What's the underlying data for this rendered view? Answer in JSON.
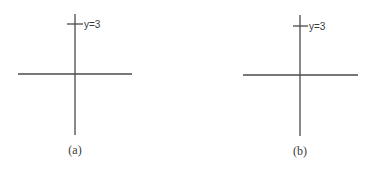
{
  "panels": [
    {
      "id": "a",
      "caption": "(a)",
      "tick_label": "y=3",
      "origin": {
        "x": 75,
        "y": 74
      },
      "x_axis": {
        "x1": 18,
        "x2": 132
      },
      "y_axis": {
        "y1": 14,
        "y2": 135
      },
      "tick": {
        "y": 24,
        "x1": 67,
        "x2": 83
      },
      "caption_pos": {
        "x": 75,
        "y": 154
      }
    },
    {
      "id": "b",
      "caption": "(b)",
      "tick_label": "y=3",
      "origin": {
        "x": 300,
        "y": 75
      },
      "x_axis": {
        "x1": 243,
        "x2": 358
      },
      "y_axis": {
        "y1": 15,
        "y2": 136
      },
      "tick": {
        "y": 26,
        "x1": 293,
        "x2": 308
      },
      "caption_pos": {
        "x": 300,
        "y": 155
      }
    }
  ],
  "colors": {
    "axis": "#4a4a4a",
    "text": "#3a3a3a",
    "background": "#ffffff"
  }
}
